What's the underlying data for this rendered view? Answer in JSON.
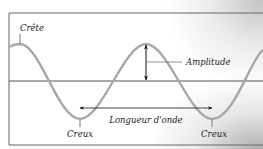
{
  "diagram": {
    "type": "wave",
    "labels": {
      "crest": "Crête",
      "amplitude": "Amplitude",
      "wavelength": "Longueur d'onde",
      "trough_left": "Creux",
      "trough_right": "Creux"
    },
    "colors": {
      "wave": "#a8a8a8",
      "frame": "#555555",
      "axis": "#555555",
      "arrow": "#111111",
      "text": "#222222"
    }
  }
}
